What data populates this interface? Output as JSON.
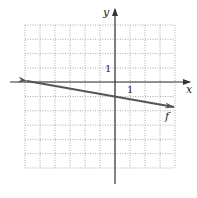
{
  "chart_data": {
    "type": "line",
    "title": "",
    "xlabel": "x",
    "ylabel": "y",
    "xlim": [
      -6,
      4
    ],
    "ylim": [
      -6,
      4
    ],
    "grid": true,
    "grid_style": "dotted",
    "tick_labels": {
      "x_unit": "1",
      "y_unit": "1"
    },
    "series": [
      {
        "name": "f",
        "x": [
          -6,
          4
        ],
        "y": [
          0,
          -1.67
        ],
        "slope": -0.1667,
        "y_intercept": -1,
        "arrows_both_ends": true
      }
    ],
    "colors": {
      "axis": "#333333",
      "line": "#555555",
      "grid": "#aaaaaa"
    }
  },
  "labels": {
    "x_axis": "x",
    "y_axis": "y",
    "x_tick": "1",
    "y_tick": "1",
    "function": "f"
  }
}
